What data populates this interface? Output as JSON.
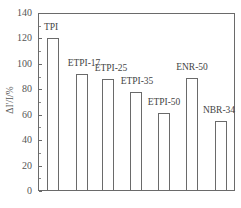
{
  "chart_data": {
    "type": "bar",
    "title": "",
    "xlabel": "",
    "ylabel": "ΔI'/I/%",
    "ylim": [
      0,
      140
    ],
    "yticks": [
      0,
      20,
      40,
      60,
      80,
      100,
      120,
      140
    ],
    "grid": false,
    "legend": null,
    "categories": [
      "TPI",
      "ETPI-17",
      "ETPI-25",
      "ETPI-35",
      "ETPI-50",
      "ENR-50",
      "NBR-34"
    ],
    "values": [
      120,
      92,
      88,
      78,
      61,
      89,
      55
    ],
    "bar_labels_above": true,
    "colors": {
      "bar_fill": "#ffffff",
      "bar_edge": "#6a6a6a",
      "axis": "#6a6a6a"
    }
  },
  "axis": {
    "y_tick_labels": [
      "0",
      "20",
      "40",
      "60",
      "80",
      "100",
      "120",
      "140"
    ]
  },
  "bars": [
    {
      "label": "TPI",
      "value": 120,
      "left": 47,
      "width": 12,
      "label_x": 51,
      "label_offset": 16
    },
    {
      "label": "ETPI-17",
      "value": 92,
      "left": 76,
      "width": 12,
      "label_x": 84,
      "label_offset": 16
    },
    {
      "label": "ETPI-25",
      "value": 88,
      "left": 102,
      "width": 12,
      "label_x": 111,
      "label_offset": 16
    },
    {
      "label": "ETPI-35",
      "value": 78,
      "left": 130,
      "width": 12,
      "label_x": 137,
      "label_offset": 16
    },
    {
      "label": "ETPI-50",
      "value": 61,
      "left": 158,
      "width": 12,
      "label_x": 164,
      "label_offset": 16
    },
    {
      "label": "ENR-50",
      "value": 89,
      "left": 186,
      "width": 12,
      "label_x": 192,
      "label_offset": 16
    },
    {
      "label": "NBR-34",
      "value": 55,
      "left": 215,
      "width": 12,
      "label_x": 219,
      "label_offset": 16
    }
  ]
}
